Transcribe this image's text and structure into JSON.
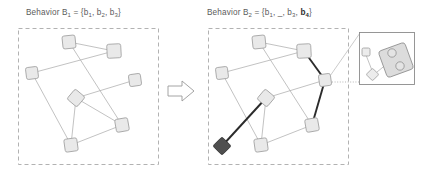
{
  "figure": {
    "type": "diagram",
    "caption_left": "Behavior B1 = {b1, b2, b3}",
    "caption_right": "Behavior B2 = {b1, _, b3, b4}"
  },
  "panels": {
    "left": {
      "title_prefix": "Behavior B",
      "title_index": "1",
      "title_eq": " = {b",
      "t_s1": "1",
      "t_c1": ", b",
      "t_s2": "2",
      "t_c2": ", b",
      "t_s3": "3",
      "t_close": "}"
    },
    "right": {
      "title_prefix": "Behavior B",
      "title_index": "2",
      "title_eq": " = {b",
      "t_s1": "1",
      "t_c1": ", _, b",
      "t_s3": "3",
      "t_c2": ", ",
      "t_bold": "b",
      "t_bold_sub": "4",
      "t_close": "}"
    }
  },
  "graph_left": {
    "nodes": [
      {
        "id": "L1",
        "x": 69,
        "y": 42,
        "size": 13,
        "rot": -6,
        "style": "light"
      },
      {
        "id": "L2",
        "x": 114,
        "y": 51,
        "size": 14,
        "rot": -3,
        "style": "light"
      },
      {
        "id": "L3",
        "x": 32,
        "y": 73,
        "size": 12,
        "rot": -7,
        "style": "light"
      },
      {
        "id": "L4",
        "x": 135,
        "y": 80,
        "size": 12,
        "rot": -8,
        "style": "light"
      },
      {
        "id": "L5",
        "x": 76,
        "y": 98,
        "size": 13,
        "rot": 40,
        "style": "light"
      },
      {
        "id": "L6",
        "x": 122,
        "y": 125,
        "size": 13,
        "rot": -10,
        "style": "light"
      },
      {
        "id": "L7",
        "x": 71,
        "y": 145,
        "size": 13,
        "rot": -8,
        "style": "light"
      }
    ],
    "edges": [
      {
        "from": "L1",
        "to": "L2"
      },
      {
        "from": "L1",
        "to": "L6"
      },
      {
        "from": "L3",
        "to": "L2"
      },
      {
        "from": "L3",
        "to": "L7"
      },
      {
        "from": "L5",
        "to": "L4"
      },
      {
        "from": "L5",
        "to": "L6"
      },
      {
        "from": "L5",
        "to": "L7"
      },
      {
        "from": "L6",
        "to": "L7"
      }
    ]
  },
  "graph_right": {
    "nodes": [
      {
        "id": "R1",
        "x": 259,
        "y": 42,
        "size": 13,
        "rot": -6,
        "style": "light"
      },
      {
        "id": "R2",
        "x": 304,
        "y": 51,
        "size": 14,
        "rot": -3,
        "style": "light"
      },
      {
        "id": "R3",
        "x": 222,
        "y": 73,
        "size": 12,
        "rot": -7,
        "style": "light"
      },
      {
        "id": "R4",
        "x": 325,
        "y": 80,
        "size": 12,
        "rot": -8,
        "style": "light"
      },
      {
        "id": "R5",
        "x": 266,
        "y": 98,
        "size": 13,
        "rot": 40,
        "style": "light"
      },
      {
        "id": "R6",
        "x": 312,
        "y": 125,
        "size": 13,
        "rot": -10,
        "style": "light"
      },
      {
        "id": "R7",
        "x": 261,
        "y": 145,
        "size": 13,
        "rot": -8,
        "style": "light"
      },
      {
        "id": "R8",
        "x": 222,
        "y": 146,
        "size": 13,
        "rot": 45,
        "style": "dark"
      }
    ],
    "edges": [
      {
        "from": "R1",
        "to": "R2",
        "bold": false
      },
      {
        "from": "R1",
        "to": "R6",
        "bold": false
      },
      {
        "from": "R3",
        "to": "R2",
        "bold": false
      },
      {
        "from": "R3",
        "to": "R7",
        "bold": false
      },
      {
        "from": "R5",
        "to": "R4",
        "bold": false
      },
      {
        "from": "R5",
        "to": "R7",
        "bold": false
      },
      {
        "from": "R6",
        "to": "R7",
        "bold": false
      },
      {
        "from": "R2",
        "to": "R4",
        "bold": true
      },
      {
        "from": "R4",
        "to": "R6",
        "bold": true
      },
      {
        "from": "R8",
        "to": "R5",
        "bold": true
      }
    ],
    "highlight_node": "R8",
    "highlight_path": [
      "R8",
      "R5",
      "R4",
      "R2",
      "R6"
    ]
  },
  "arrow": {
    "label": "transition-arrow"
  },
  "inset": {
    "label": "zoom-detail",
    "source_node": "R4",
    "shapes": [
      {
        "kind": "small-square",
        "x": 364,
        "y": 52
      },
      {
        "kind": "diamond",
        "x": 372,
        "y": 74
      },
      {
        "kind": "big-rounded-rect",
        "x": 396,
        "y": 60
      },
      {
        "kind": "circle",
        "x": 392,
        "y": 53
      },
      {
        "kind": "circle",
        "x": 401,
        "y": 67
      }
    ]
  },
  "colors": {
    "node_fill": "#e9e9e9",
    "node_stroke": "#9d9d9d",
    "node_dark_fill": "#4f4f4f",
    "edge": "#a8a8a8",
    "edge_bold": "#2b2b2b",
    "dash_box": "#a9a9a9",
    "text": "#5c5c5c",
    "background": "#ffffff"
  }
}
